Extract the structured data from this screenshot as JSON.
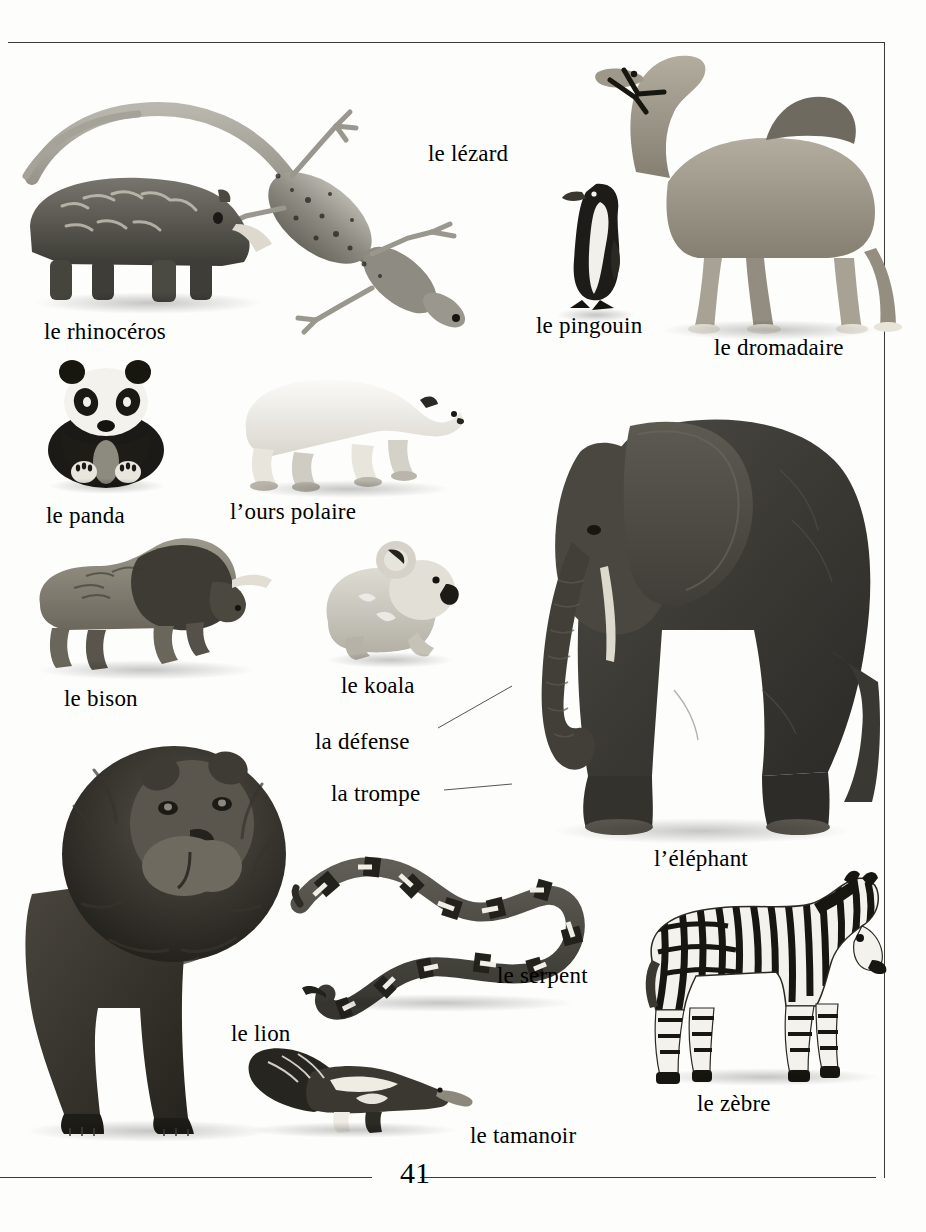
{
  "page": {
    "number": "41",
    "language": "fr",
    "background_color": "#fdfdfc",
    "frame_color": "#3a3a3a"
  },
  "labels": [
    {
      "id": "lezard",
      "text": "le lézard",
      "x": 428,
      "y": 142,
      "subject": "lizard"
    },
    {
      "id": "rhinoceros",
      "text": "le rhinocéros",
      "x": 44,
      "y": 320,
      "subject": "rhinoceros"
    },
    {
      "id": "pingouin",
      "text": "le pingouin",
      "x": 536,
      "y": 314,
      "subject": "penguin"
    },
    {
      "id": "dromadaire",
      "text": "le dromadaire",
      "x": 714,
      "y": 336,
      "subject": "camel"
    },
    {
      "id": "panda",
      "text": "le panda",
      "x": 46,
      "y": 504,
      "subject": "panda"
    },
    {
      "id": "ours",
      "text": "l’ours polaire",
      "x": 230,
      "y": 500,
      "subject": "polar-bear"
    },
    {
      "id": "bison",
      "text": "le bison",
      "x": 64,
      "y": 687,
      "subject": "bison"
    },
    {
      "id": "koala",
      "text": "le koala",
      "x": 341,
      "y": 674,
      "subject": "koala"
    },
    {
      "id": "defense",
      "text": "la défense",
      "x": 315,
      "y": 730,
      "subject": "elephant-tusk"
    },
    {
      "id": "trompe",
      "text": "la trompe",
      "x": 331,
      "y": 782,
      "subject": "elephant-trunk"
    },
    {
      "id": "elephant",
      "text": "l’éléphant",
      "x": 654,
      "y": 847,
      "subject": "elephant"
    },
    {
      "id": "serpent",
      "text": "le serpent",
      "x": 497,
      "y": 964,
      "subject": "snake"
    },
    {
      "id": "lion",
      "text": "le lion",
      "x": 231,
      "y": 1022,
      "subject": "lion"
    },
    {
      "id": "zebre",
      "text": "le zèbre",
      "x": 697,
      "y": 1092,
      "subject": "zebra"
    },
    {
      "id": "tamanoir",
      "text": "le tamanoir",
      "x": 470,
      "y": 1124,
      "subject": "anteater"
    }
  ],
  "leaders": [
    {
      "id": "defense-leader",
      "from_x": 438,
      "from_y": 726,
      "to_x": 500,
      "to_y": 692
    },
    {
      "id": "trompe-leader",
      "from_x": 445,
      "from_y": 790,
      "to_x": 505,
      "to_y": 782
    }
  ],
  "frame": {
    "top": {
      "x": 8,
      "y": 42,
      "w": 876,
      "h": 1
    },
    "right": {
      "x": 884,
      "y": 42,
      "w": 1,
      "h": 1136
    },
    "bottom_left": {
      "x": 0,
      "y": 1177,
      "w": 372,
      "h": 1
    },
    "bottom_right": {
      "x": 420,
      "y": 1177,
      "w": 456,
      "h": 1
    }
  },
  "page_number_pos": {
    "x": 400,
    "y": 1160
  }
}
